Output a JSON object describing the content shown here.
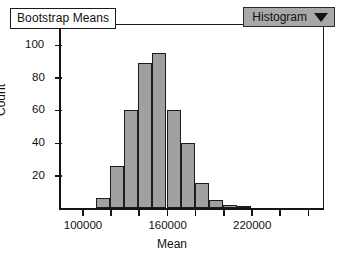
{
  "title_box": {
    "label": "Bootstrap Means"
  },
  "dropdown": {
    "label": "Histogram",
    "caret_icon": "chevron-down-icon"
  },
  "axes": {
    "xlabel": "Mean",
    "ylabel": "Count",
    "y_ticks": [
      "20",
      "40",
      "60",
      "80",
      "100"
    ],
    "x_ticks": [
      "100000",
      "160000",
      "220000"
    ]
  },
  "colors": {
    "bar_fill": "#a0a0a0",
    "bar_edge": "#1c1c1c",
    "axis": "#151515",
    "dropdown_bg": "#a8a8a8",
    "background": "#ffffff"
  },
  "chart_data": {
    "type": "bar",
    "title": "Bootstrap Means",
    "xlabel": "Mean",
    "ylabel": "Count",
    "xlim": [
      90000,
      260000
    ],
    "ylim": [
      0,
      105
    ],
    "grid": false,
    "legend": "none",
    "bin_width": 10000,
    "bin_starts": [
      130000,
      140000,
      150000,
      160000,
      170000,
      180000,
      190000,
      200000,
      210000,
      220000,
      230000
    ],
    "categories": [
      "130000",
      "140000",
      "150000",
      "160000",
      "170000",
      "180000",
      "190000",
      "200000",
      "210000",
      "220000",
      "230000"
    ],
    "values": [
      6,
      26,
      60,
      89,
      95,
      60,
      40,
      15,
      5,
      2,
      1
    ],
    "y_tick_values": [
      20,
      40,
      60,
      80,
      100
    ],
    "x_tick_values": [
      100000,
      160000,
      220000
    ]
  }
}
